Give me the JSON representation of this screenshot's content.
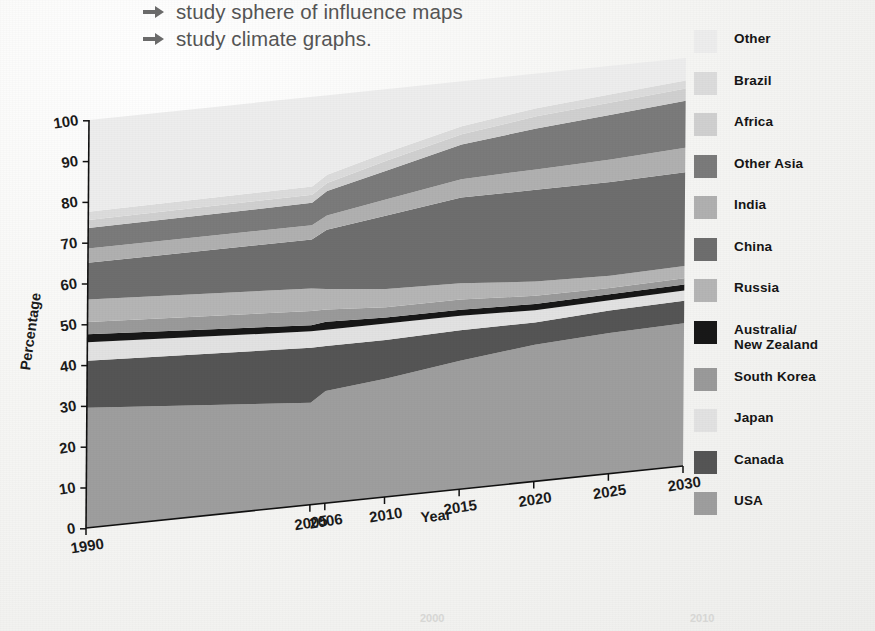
{
  "heading": {
    "bullets": [
      "study sphere of influence maps",
      "study climate graphs."
    ],
    "arrow_icon": "arrow-right-icon"
  },
  "chart_data": {
    "type": "area",
    "title": "",
    "xlabel": "Year",
    "ylabel": "Percentage",
    "x": [
      1990,
      2005,
      2006,
      2010,
      2015,
      2020,
      2025,
      2030
    ],
    "xtick_labels": [
      "1990",
      "2005",
      "2006",
      "2010",
      "2015",
      "2020",
      "2025",
      "2030"
    ],
    "ytick_labels": [
      "0",
      "10",
      "20",
      "30",
      "40",
      "50",
      "60",
      "70",
      "80",
      "90",
      "100"
    ],
    "ylim": [
      0,
      100
    ],
    "grid": false,
    "legend_position": "right",
    "stacked": true,
    "series": [
      {
        "name": "USA",
        "color": "#9e9e9e",
        "values": [
          29.5,
          25.0,
          27.5,
          29.0,
          31.5,
          33.5,
          34.5,
          35.0
        ]
      },
      {
        "name": "Canada",
        "color": "#555555",
        "values": [
          11.5,
          13.5,
          11.0,
          9.5,
          7.5,
          5.5,
          5.5,
          5.5
        ]
      },
      {
        "name": "Japan",
        "color": "#e2e2e2",
        "values": [
          4.5,
          4.0,
          4.0,
          4.0,
          3.5,
          3.0,
          2.5,
          2.5
        ]
      },
      {
        "name": "Australia/\nNew Zealand",
        "color": "#181818",
        "values": [
          2.0,
          1.5,
          2.0,
          1.5,
          1.5,
          1.5,
          1.5,
          1.5
        ]
      },
      {
        "name": "South Korea",
        "color": "#9a9a9a",
        "values": [
          3.0,
          3.5,
          3.0,
          2.5,
          2.5,
          2.0,
          1.5,
          1.5
        ]
      },
      {
        "name": "Russia",
        "color": "#b5b5b5",
        "values": [
          5.5,
          5.5,
          5.0,
          4.5,
          4.0,
          3.5,
          3.0,
          3.0
        ]
      },
      {
        "name": "China",
        "color": "#6e6e6e",
        "values": [
          9.0,
          12.0,
          14.5,
          18.0,
          21.0,
          22.5,
          23.0,
          23.0
        ]
      },
      {
        "name": "India",
        "color": "#b0b0b0",
        "values": [
          3.5,
          3.5,
          3.5,
          4.0,
          4.5,
          5.0,
          5.5,
          6.0
        ]
      },
      {
        "name": "Other Asia",
        "color": "#7b7b7b",
        "values": [
          5.0,
          5.5,
          6.0,
          7.0,
          8.5,
          10.0,
          11.0,
          11.5
        ]
      },
      {
        "name": "Africa",
        "color": "#d0d0d0",
        "values": [
          2.0,
          2.0,
          2.0,
          2.5,
          2.5,
          3.0,
          3.0,
          3.0
        ]
      },
      {
        "name": "Brazil",
        "color": "#dcdcdc",
        "values": [
          2.0,
          2.0,
          2.0,
          2.0,
          2.0,
          2.0,
          2.0,
          2.0
        ]
      },
      {
        "name": "Other",
        "color": "#ededed",
        "values": [
          22.5,
          22.0,
          19.5,
          15.5,
          11.0,
          8.5,
          7.0,
          5.5
        ]
      }
    ]
  },
  "legend": {
    "items": [
      {
        "label": "Other",
        "swatch": "#ededed"
      },
      {
        "label": "Brazil",
        "swatch": "#dcdcdc"
      },
      {
        "label": "Africa",
        "swatch": "#d0d0d0"
      },
      {
        "label": "Other Asia",
        "swatch": "#7b7b7b"
      },
      {
        "label": "India",
        "swatch": "#b0b0b0"
      },
      {
        "label": "China",
        "swatch": "#6e6e6e"
      },
      {
        "label": "Russia",
        "swatch": "#b5b5b5"
      },
      {
        "label": "Australia/\nNew Zealand",
        "swatch": "#181818"
      },
      {
        "label": "South Korea",
        "swatch": "#9a9a9a"
      },
      {
        "label": "Japan",
        "swatch": "#e2e2e2"
      },
      {
        "label": "Canada",
        "swatch": "#555555"
      },
      {
        "label": "USA",
        "swatch": "#9e9e9e"
      }
    ]
  },
  "artifacts": {
    "ghost_left": "2000",
    "ghost_right": "2010"
  }
}
